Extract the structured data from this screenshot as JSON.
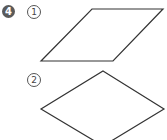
{
  "problem": {
    "number": "4",
    "items": [
      {
        "label": "1",
        "shape": "parallelogram"
      },
      {
        "label": "2",
        "shape": "rhombus"
      }
    ]
  },
  "colors": {
    "badge": "#5a5a5a",
    "stroke": "#333333"
  }
}
